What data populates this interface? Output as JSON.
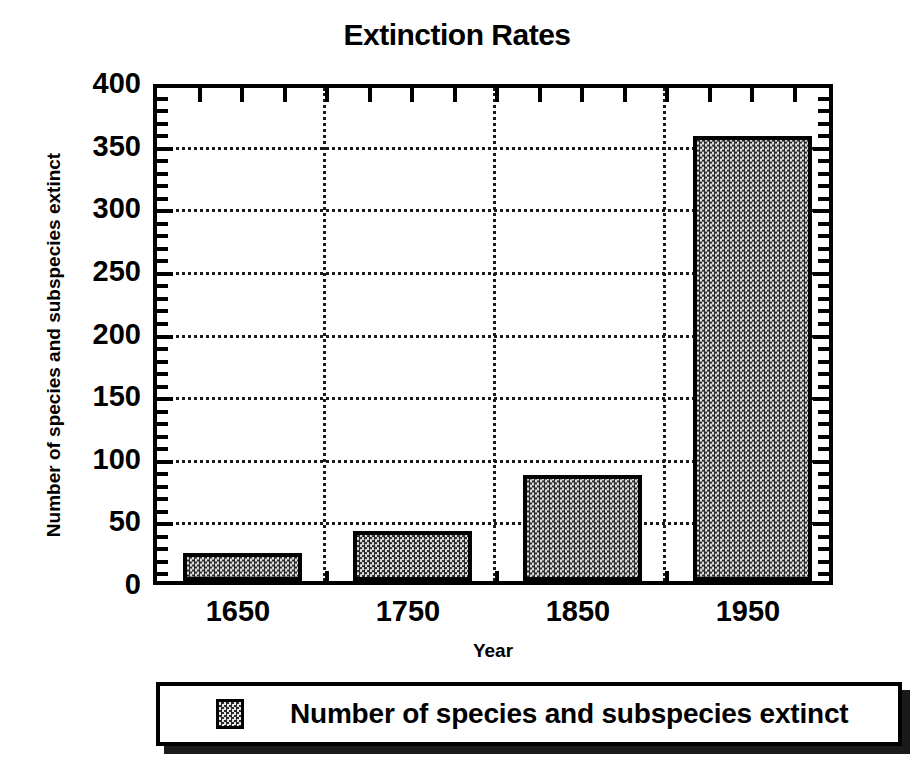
{
  "chart_data": {
    "type": "bar",
    "title": "Extinction Rates",
    "xlabel": "Year",
    "ylabel": "Number of species and subspecies extinct",
    "categories": [
      "1650",
      "1750",
      "1850",
      "1950"
    ],
    "values": [
      22,
      40,
      85,
      355
    ],
    "series": [
      {
        "name": "Number of species and subspecies extinct",
        "values": [
          22,
          40,
          85,
          355
        ]
      }
    ],
    "ylim": [
      0,
      400
    ],
    "ytick_labels": [
      "400",
      "350",
      "300",
      "250",
      "200",
      "150",
      "100",
      "50",
      "0"
    ],
    "ytick_values": [
      400,
      350,
      300,
      250,
      200,
      150,
      100,
      50,
      0
    ],
    "ytick_step": 50,
    "minor_ticks_per_major": 5,
    "grid": "horizontal-dotted-and-vertical-category-dividers",
    "legend_position": "below-plot",
    "legend_entries": [
      {
        "label": "Number of species and subspecies extinct",
        "swatch": "checkered-gray"
      }
    ],
    "bar_fill": "checkered-dither-gray",
    "bar_outline_color": "#000000",
    "frame_color": "#000000",
    "background_color": "#ffffff"
  }
}
